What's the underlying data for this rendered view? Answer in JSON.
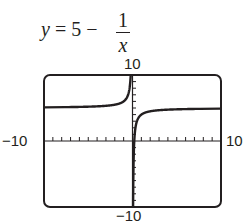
{
  "equation": {
    "lhs": "y",
    "eq": "= 5 −",
    "numerator": "1",
    "denominator": "x"
  },
  "axis_labels": {
    "ymax": "10",
    "ymin": "−10",
    "xmin": "−10",
    "xmax": "10"
  },
  "chart_data": {
    "type": "line",
    "function": "5 - 1/x",
    "xlabel": "",
    "ylabel": "",
    "xlim": [
      -10,
      10
    ],
    "ylim": [
      -10,
      10
    ],
    "xtick_step": 1,
    "ytick_step": 1,
    "grid": false,
    "asymptotes": {
      "vertical": 0,
      "horizontal": 5
    },
    "series": [
      {
        "name": "y = 5 - 1/x (x<0)",
        "x": [
          -10,
          -5,
          -2,
          -1,
          -0.5,
          -0.2,
          -0.2
        ],
        "y": [
          5.1,
          5.2,
          5.5,
          6,
          7,
          10,
          10
        ]
      },
      {
        "name": "y = 5 - 1/x (x>0)",
        "x": [
          0.067,
          0.1,
          0.2,
          0.5,
          1,
          2,
          5,
          10
        ],
        "y": [
          -10,
          -5,
          0,
          3,
          4,
          4.5,
          4.8,
          4.9
        ]
      }
    ]
  }
}
